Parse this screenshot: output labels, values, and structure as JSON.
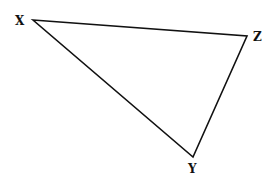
{
  "diagram": {
    "type": "triangle",
    "stroke_color": "#111111",
    "background": "#ffffff",
    "vertices": [
      {
        "id": "X",
        "label": "X",
        "x": 33,
        "y": 20,
        "label_x": 15,
        "label_y": 25
      },
      {
        "id": "Z",
        "label": "Z",
        "x": 247,
        "y": 36,
        "label_x": 253,
        "label_y": 41
      },
      {
        "id": "Y",
        "label": "Y",
        "x": 193,
        "y": 157,
        "label_x": 188,
        "label_y": 173
      }
    ],
    "edges": [
      {
        "from": "X",
        "to": "Z"
      },
      {
        "from": "Z",
        "to": "Y"
      },
      {
        "from": "Y",
        "to": "X"
      }
    ]
  }
}
